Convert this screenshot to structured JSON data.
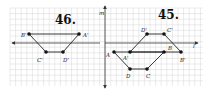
{
  "figure": {
    "width": 209,
    "height": 90,
    "grid": {
      "x0": 10,
      "y0": 8,
      "x1": 203,
      "y1": 86,
      "step": 5.6,
      "color": "#d6d6d6"
    },
    "axis_m": {
      "label": "m",
      "x": 105,
      "y_top": 6,
      "y_bottom": 88
    },
    "panels": [
      {
        "id": "46",
        "title": "46.",
        "title_pos": [
          55,
          24
        ],
        "line": {
          "label": "",
          "y": 43,
          "x_from": 100,
          "x_to": 12,
          "arrow": "left"
        },
        "points": [
          {
            "name": "B'",
            "x": 29,
            "y": 34,
            "lx": 21,
            "ly": 37
          },
          {
            "name": "A'",
            "x": 79,
            "y": 34,
            "lx": 83,
            "ly": 37
          },
          {
            "name": "C'",
            "x": 46,
            "y": 52,
            "lx": 37,
            "ly": 62
          },
          {
            "name": "D'",
            "x": 63,
            "y": 52,
            "lx": 63,
            "ly": 62
          }
        ],
        "segments": [
          [
            "B'",
            "A'"
          ],
          [
            "B'",
            "C'"
          ],
          [
            "C'",
            "D'"
          ],
          [
            "D'",
            "A'"
          ]
        ]
      },
      {
        "id": "45",
        "title": "45.",
        "title_pos": [
          158,
          19
        ],
        "line": {
          "label": "l",
          "y": 43,
          "x_from": 105,
          "x_to": 198,
          "arrow": "right"
        },
        "points": [
          {
            "name": "A",
            "x": 114,
            "y": 52,
            "lx": 106,
            "ly": 57
          },
          {
            "name": "A'",
            "x": 130,
            "y": 52,
            "lx": 123,
            "ly": 60
          },
          {
            "name": "B",
            "x": 164,
            "y": 52,
            "lx": 168,
            "ly": 50
          },
          {
            "name": "B'",
            "x": 181,
            "y": 52,
            "lx": 180,
            "ly": 62
          },
          {
            "name": "D'",
            "x": 147,
            "y": 34,
            "lx": 141,
            "ly": 32
          },
          {
            "name": "C'",
            "x": 164,
            "y": 34,
            "lx": 167,
            "ly": 32
          },
          {
            "name": "D",
            "x": 130,
            "y": 69,
            "lx": 126,
            "ly": 78
          },
          {
            "name": "C",
            "x": 147,
            "y": 69,
            "lx": 146,
            "ly": 78
          }
        ],
        "segments": [
          [
            "A",
            "B"
          ],
          [
            "A",
            "D"
          ],
          [
            "D",
            "C"
          ],
          [
            "C",
            "B"
          ],
          [
            "A'",
            "B'"
          ],
          [
            "A'",
            "D'"
          ],
          [
            "D'",
            "C'"
          ],
          [
            "C'",
            "B'"
          ]
        ]
      }
    ],
    "line_l_label_pos": [
      193,
      48
    ]
  }
}
